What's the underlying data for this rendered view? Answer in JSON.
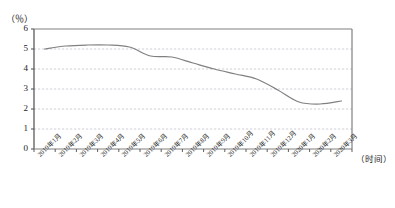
{
  "chart_data": {
    "type": "line",
    "title": "",
    "subtitle": "",
    "xlabel": "（时间）",
    "ylabel": "（％）",
    "ylim": [
      0,
      6
    ],
    "yticks": [
      0,
      1,
      2,
      3,
      4,
      5,
      6
    ],
    "ytick_labels": [
      "0",
      "1",
      "2",
      "3",
      "4",
      "5",
      "6"
    ],
    "grid": true,
    "grid_style": "dashed-horizontal",
    "legend": "none",
    "line_color": "#808080",
    "categories": [
      "2019年1月",
      "2019年2月",
      "2019年3月",
      "2019年4月",
      "2019年5月",
      "2019年6月",
      "2019年7月",
      "2019年8月",
      "2019年9月",
      "2019年10月",
      "2019年11月",
      "2019年12月",
      "2020年1月",
      "2020年2月",
      "2020年3月"
    ],
    "series": [
      {
        "name": "",
        "values": [
          5.0,
          5.15,
          5.2,
          5.2,
          5.1,
          4.65,
          4.6,
          4.3,
          4.0,
          3.75,
          3.5,
          2.95,
          2.35,
          2.25,
          2.4
        ]
      }
    ]
  },
  "axes": {
    "y_unit_label": "（％）",
    "x_unit_label": "（时间）"
  }
}
